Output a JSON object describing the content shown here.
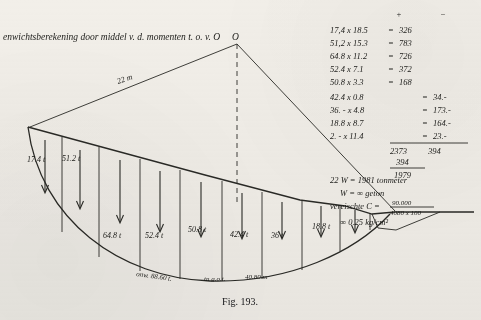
{
  "figure": {
    "caption": "Fig. 193.",
    "heading": "enwichtsberekening door middel v. d. momenten t. o. v.  O",
    "pole_label": "O",
    "radius_label": "22  m",
    "bottom_note_left": "onw. 88.60 t.",
    "bottom_note_mid": "tn g.o.t.",
    "bottom_note_right": "40.80 m"
  },
  "force_labels": [
    "17.4 t",
    "51.2 t",
    "64.8 t",
    "52.4 t",
    "50.8 t",
    "42.4 t",
    "36 t",
    "18.8 t"
  ],
  "calc": {
    "sign_plus": "+",
    "sign_minus": "−",
    "rows": [
      {
        "expr": "17,4 x 18.5",
        "eq": "=",
        "plus": "326",
        "minus": ""
      },
      {
        "expr": "51,2 x 15.3",
        "eq": "=",
        "plus": "783",
        "minus": ""
      },
      {
        "expr": "64.8 x 11.2",
        "eq": "=",
        "plus": "726",
        "minus": ""
      },
      {
        "expr": "52.4 x 7.1",
        "eq": "=",
        "plus": "372",
        "minus": ""
      },
      {
        "expr": "50.8 x 3.3",
        "eq": "=",
        "plus": "168",
        "minus": ""
      },
      {
        "expr": "42.4 x 0.8",
        "eq": "=",
        "plus": "",
        "minus": "34.-"
      },
      {
        "expr": "36. - x 4.8",
        "eq": "=",
        "plus": "",
        "minus": "173.-"
      },
      {
        "expr": "18.8 x 8.7",
        "eq": "=",
        "plus": "",
        "minus": "164.-"
      },
      {
        "expr": "2. - x 11.4",
        "eq": "=",
        "plus": "",
        "minus": "23.-"
      }
    ],
    "subtotal_plus": "2373",
    "subtotal_minus": "394",
    "carry": "394",
    "total": "1979",
    "result_line_1": "22 W  =  1981 tonmeter",
    "result_line_2": "W = ∞ geton",
    "result_line_3": "vereischte C =",
    "result_frac_num": "90.000",
    "result_frac_den": "4080 x 100",
    "result_line_4": "∞ 0.25 kg/cm²"
  }
}
